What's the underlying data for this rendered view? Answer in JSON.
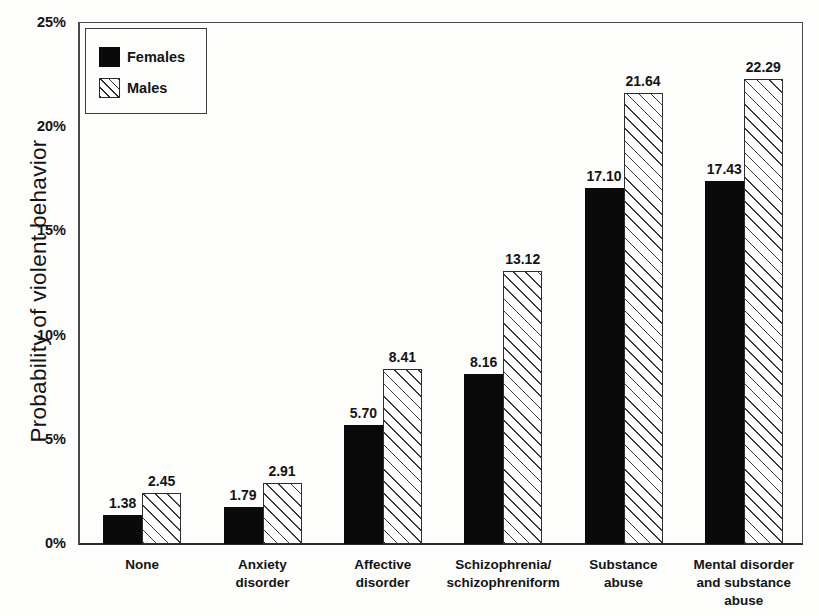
{
  "chart_data": {
    "type": "bar",
    "title": "",
    "xlabel": "",
    "ylabel": "Probability of violent behavior",
    "ylim": [
      0,
      25
    ],
    "yticks": [
      "0%",
      "5%",
      "10%",
      "15%",
      "20%",
      "25%"
    ],
    "ytick_values": [
      0,
      5,
      10,
      15,
      20,
      25
    ],
    "grid": false,
    "legend_position": "upper-left-inside",
    "categories": [
      "None",
      "Anxiety disorder",
      "Affective disorder",
      "Schizophrenia/ schizophreniform",
      "Substance abuse",
      "Mental disorder and substance abuse"
    ],
    "category_lines": [
      [
        "None"
      ],
      [
        "Anxiety",
        "disorder"
      ],
      [
        "Affective",
        "disorder"
      ],
      [
        "Schizophrenia/",
        "schizophreniform"
      ],
      [
        "Substance",
        "abuse"
      ],
      [
        "Mental disorder",
        "and substance",
        "abuse"
      ]
    ],
    "series": [
      {
        "name": "Females",
        "values": [
          1.38,
          1.79,
          5.7,
          8.16,
          17.1,
          17.43
        ],
        "labels": [
          "1.38",
          "1.79",
          "5.70",
          "8.16",
          "17.10",
          "17.43"
        ],
        "fill": "solid-black",
        "color": "#0a0a0a"
      },
      {
        "name": "Males",
        "values": [
          2.45,
          2.91,
          8.41,
          13.12,
          21.64,
          22.29
        ],
        "labels": [
          "2.45",
          "2.91",
          "8.41",
          "13.12",
          "21.64",
          "22.29"
        ],
        "fill": "diagonal-hatch",
        "color": "#ffffff"
      }
    ]
  },
  "legend": {
    "items": [
      {
        "label": "Females",
        "swatch": "solid-black-swatch"
      },
      {
        "label": "Males",
        "swatch": "hatched-swatch"
      }
    ]
  }
}
